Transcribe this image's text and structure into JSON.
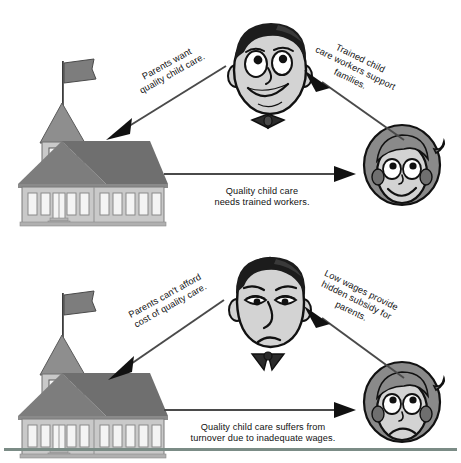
{
  "figure": {
    "type": "two-panel relationship diagram",
    "panels": [
      {
        "id": "positive-cycle",
        "name": "top-diagram",
        "nodes": [
          {
            "id": "school",
            "name": "schoolhouse",
            "icon": "schoolhouse-icon",
            "mood": "neutral"
          },
          {
            "id": "parent",
            "name": "parent-face",
            "icon": "man-face-smiling-icon",
            "mood": "happy"
          },
          {
            "id": "worker",
            "name": "child-care-worker-face",
            "icon": "woman-face-smiling-icon",
            "mood": "happy"
          }
        ],
        "arrows": [
          {
            "id": "parent-to-school",
            "from": "parent",
            "to": "school",
            "label": "Parents want\nquality child care."
          },
          {
            "id": "worker-to-parent",
            "from": "worker",
            "to": "parent",
            "label": "Trained child\ncare workers support\nfamilies."
          },
          {
            "id": "school-to-worker",
            "from": "school",
            "to": "worker",
            "label": "Quality child care\nneeds trained workers."
          }
        ]
      },
      {
        "id": "negative-cycle",
        "name": "bottom-diagram",
        "nodes": [
          {
            "id": "school2",
            "name": "schoolhouse",
            "icon": "schoolhouse-icon",
            "mood": "neutral"
          },
          {
            "id": "parent2",
            "name": "parent-face",
            "icon": "man-face-frowning-icon",
            "mood": "unhappy"
          },
          {
            "id": "worker2",
            "name": "child-care-worker-face",
            "icon": "woman-face-frowning-icon",
            "mood": "unhappy"
          }
        ],
        "arrows": [
          {
            "id": "parent-to-school-2",
            "from": "parent2",
            "to": "school2",
            "label": "Parents can't afford\ncost of quality care."
          },
          {
            "id": "worker-to-parent-2",
            "from": "worker2",
            "to": "parent2",
            "label": "Low wages provide\nhidden subsidy for\nparents."
          },
          {
            "id": "school-to-worker-2",
            "from": "school2",
            "to": "worker2",
            "label": "Quality child care suffers from\nturnover due to inadequate wages."
          }
        ]
      }
    ]
  },
  "colors": {
    "roof": "#7d7d7d",
    "wall": "#c9c9c9",
    "window": "#f2f2f2",
    "skin": "#d3d3d3",
    "hair": "#1c1c1c",
    "hair_woman": "#8a8a8a",
    "arrow": "#4a4a4a",
    "outline": "#111111",
    "rule": "#7b8c86"
  }
}
